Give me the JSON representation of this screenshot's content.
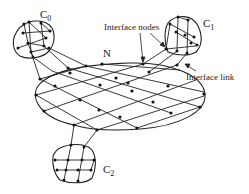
{
  "diagram": {
    "type": "network-of-clusters",
    "labels": {
      "central_network": "N",
      "cluster_0": "C",
      "cluster_0_sub": "0",
      "cluster_1": "C",
      "cluster_1_sub": "1",
      "cluster_2": "C",
      "cluster_2_sub": "2",
      "interface_nodes": "Interface nodes",
      "interface_link": "Interface link"
    },
    "colors": {
      "line": "#222222",
      "node": "#111111",
      "background": "#ffffff"
    },
    "clusters": [
      {
        "id": "C0",
        "position": "top-left"
      },
      {
        "id": "C1",
        "position": "top-right"
      },
      {
        "id": "C2",
        "position": "bottom"
      }
    ],
    "central": {
      "id": "N",
      "shape": "ellipse",
      "mesh": "grid"
    }
  }
}
